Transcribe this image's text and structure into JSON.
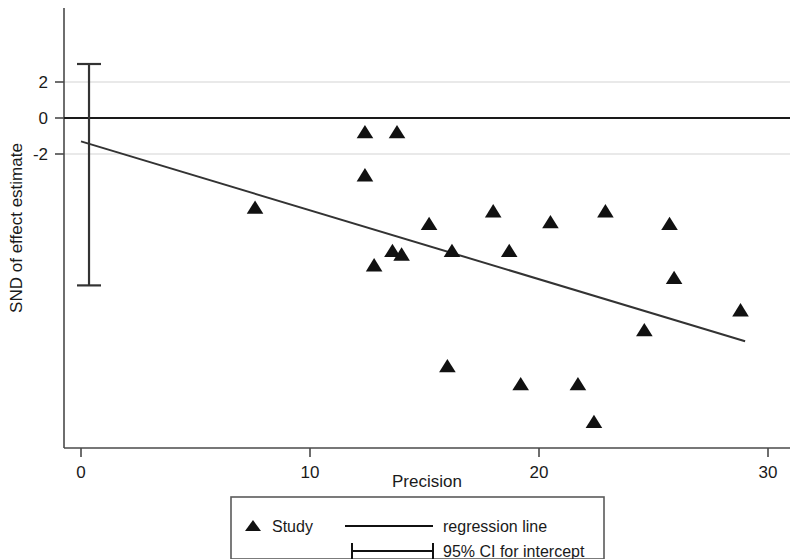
{
  "chart_data": {
    "type": "scatter",
    "title": "",
    "xlabel": "Precision",
    "ylabel": "SND of effect estimate",
    "xlim": [
      0,
      30.6
    ],
    "ylim": [
      -18.2,
      3.4
    ],
    "xticks": [
      0,
      10,
      20,
      30
    ],
    "xtick_labels": [
      "0",
      "10",
      "20",
      "30"
    ],
    "yticks": [
      2,
      0,
      -2
    ],
    "ytick_labels": [
      "2",
      "0",
      "-2"
    ],
    "grid": "horizontal-light-at-yticks",
    "legend_position": "below-plot",
    "zero_reference_line": 0,
    "marker": "filled-triangle",
    "series": [
      {
        "name": "Study",
        "points": [
          {
            "x": 7.6,
            "y": -5.0
          },
          {
            "x": 12.4,
            "y": -0.8
          },
          {
            "x": 13.8,
            "y": -0.8
          },
          {
            "x": 12.4,
            "y": -3.2
          },
          {
            "x": 12.8,
            "y": -8.2
          },
          {
            "x": 13.6,
            "y": -7.4
          },
          {
            "x": 14.0,
            "y": -7.6
          },
          {
            "x": 15.2,
            "y": -5.9
          },
          {
            "x": 16.2,
            "y": -7.4
          },
          {
            "x": 16.0,
            "y": -13.8
          },
          {
            "x": 18.0,
            "y": -5.2
          },
          {
            "x": 18.7,
            "y": -7.4
          },
          {
            "x": 19.2,
            "y": -14.8
          },
          {
            "x": 20.5,
            "y": -5.8
          },
          {
            "x": 21.7,
            "y": -14.8
          },
          {
            "x": 22.4,
            "y": -16.9
          },
          {
            "x": 22.9,
            "y": -5.2
          },
          {
            "x": 24.6,
            "y": -11.8
          },
          {
            "x": 25.7,
            "y": -5.9
          },
          {
            "x": 25.9,
            "y": -8.9
          },
          {
            "x": 28.8,
            "y": -10.7
          }
        ]
      }
    ],
    "regression_line": {
      "name": "regression line",
      "x0": 0.0,
      "y0": -1.3,
      "x1": 29.0,
      "y1": -12.4
    },
    "ci_for_intercept": {
      "name": "95% CI for intercept",
      "x": 0.35,
      "lower": -9.3,
      "upper": 3.0
    }
  },
  "legend": {
    "study_label": "Study",
    "regression_label": "regression line",
    "ci_label": "95% CI for intercept"
  },
  "axes": {
    "x_title": "Precision",
    "y_title": "SND of effect estimate"
  }
}
